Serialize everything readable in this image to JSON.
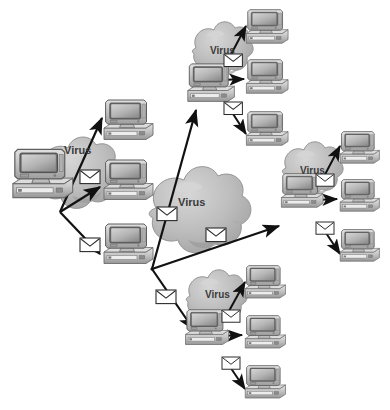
{
  "figure": {
    "background_color": "#ffffff",
    "width": 390,
    "height": 410
  },
  "palette": {
    "cloud_fill": "#bdbdbd",
    "cloud_shade": "#a2a2a2",
    "cloud_highlight": "#d2d2d2",
    "cloud_outline": "#8f8f8f",
    "monitor_case": "#c9c9c9",
    "monitor_case_dark": "#9a9a9a",
    "monitor_bezel": "#6f6f6f",
    "screen_light": "#cfcfcf",
    "screen_dark": "#8e8e8e",
    "base_light": "#d6d6d6",
    "base_dark": "#9c9c9c",
    "arrow_color": "#111111",
    "envelope_fill": "#ffffff",
    "envelope_stroke": "#2a2a2a",
    "label_color": "#3b3b3b"
  },
  "labels": {
    "virus": "Virus"
  },
  "icons": {
    "computer": "computer-icon",
    "envelope": "envelope-icon",
    "cloud": "virus-cloud-icon",
    "arrow": "arrow-icon"
  },
  "clusters": [
    {
      "id": "origin",
      "name": "origin-cluster",
      "virus_label": "Virus",
      "source_computer": {
        "name": "source-computer",
        "x": 10,
        "y": 148,
        "scale": 1.18
      },
      "cloud": {
        "x": 112,
        "y": 155,
        "scale": 1.0
      },
      "label_pos": {
        "x": 64,
        "y": 152
      },
      "targets": [
        {
          "name": "target-computer-1",
          "x": 104,
          "y": 100,
          "scale": 0.96
        },
        {
          "name": "target-computer-2",
          "x": 104,
          "y": 158,
          "scale": 0.96
        },
        {
          "name": "target-computer-3",
          "x": 104,
          "y": 218,
          "scale": 0.96
        }
      ],
      "envelopes": [
        {
          "name": "envelope-1",
          "x": 78,
          "y": 172
        },
        {
          "name": "envelope-2",
          "x": 78,
          "y": 238
        }
      ]
    },
    {
      "id": "top",
      "name": "top-cluster",
      "virus_label": "Virus",
      "source_computer": {
        "name": "source-computer",
        "x": 186,
        "y": 60,
        "scale": 0.92
      },
      "cloud": {
        "x": 243,
        "y": 28,
        "scale": 0.74
      },
      "label_pos": {
        "x": 212,
        "y": 52
      },
      "targets": [
        {
          "name": "target-computer-1",
          "x": 245,
          "y": 10,
          "scale": 0.82
        },
        {
          "name": "target-computer-2",
          "x": 245,
          "y": 60,
          "scale": 0.82
        },
        {
          "name": "target-computer-3",
          "x": 245,
          "y": 110,
          "scale": 0.82
        }
      ],
      "envelopes": [
        {
          "name": "envelope-1",
          "x": 225,
          "y": 54
        },
        {
          "name": "envelope-2",
          "x": 225,
          "y": 101
        }
      ]
    },
    {
      "id": "right",
      "name": "right-cluster",
      "virus_label": "Virus",
      "source_computer": {
        "name": "source-computer",
        "x": 282,
        "y": 172
      },
      "cloud": {
        "x": 330,
        "y": 140,
        "scale": 0.74
      },
      "label_pos": {
        "x": 306,
        "y": 172
      },
      "targets": [
        {
          "name": "target-computer-1",
          "x": 338,
          "y": 130
        },
        {
          "name": "target-computer-2",
          "x": 338,
          "y": 179
        },
        {
          "name": "target-computer-3",
          "x": 338,
          "y": 228
        }
      ],
      "envelopes": [
        {
          "name": "envelope-1",
          "x": 318,
          "y": 175
        },
        {
          "name": "envelope-2",
          "x": 318,
          "y": 222
        }
      ]
    },
    {
      "id": "bottom",
      "name": "bottom-cluster",
      "virus_label": "Virus",
      "source_computer": {
        "name": "source-computer",
        "x": 185,
        "y": 308
      },
      "cloud": {
        "x": 234,
        "y": 272
      },
      "label_pos": {
        "x": 207,
        "y": 298
      },
      "targets": [
        {
          "name": "target-computer-1",
          "x": 244,
          "y": 265
        },
        {
          "name": "target-computer-2",
          "x": 244,
          "y": 314
        },
        {
          "name": "target-computer-3",
          "x": 244,
          "y": 363
        }
      ],
      "envelopes": [
        {
          "name": "envelope-1",
          "x": 225,
          "y": 308
        },
        {
          "name": "envelope-2",
          "x": 225,
          "y": 355
        }
      ]
    }
  ],
  "central_cloud": {
    "name": "central-virus-cloud",
    "virus_label": "Virus",
    "label_pos": {
      "x": 190,
      "y": 203
    },
    "envelopes": [
      {
        "name": "envelope-center-left",
        "x": 159,
        "y": 207
      },
      {
        "name": "envelope-center-right",
        "x": 207,
        "y": 228
      }
    ]
  },
  "hub": {
    "name": "distribution-hub",
    "x": 152,
    "y": 269
  },
  "long_arrows": [
    {
      "name": "arrow-to-top-cluster",
      "from": [
        152,
        269
      ],
      "to": [
        196,
        107
      ]
    },
    {
      "name": "arrow-to-right-cluster",
      "from": [
        152,
        269
      ],
      "to": [
        281,
        225
      ]
    },
    {
      "name": "arrow-to-bottom-cluster",
      "from": [
        152,
        269
      ],
      "to": [
        196,
        330
      ]
    }
  ],
  "origin_arrows": [
    {
      "name": "arrow-origin-to-target-1",
      "from": [
        62,
        208
      ],
      "to": [
        101,
        118
      ]
    },
    {
      "name": "arrow-origin-to-target-2",
      "from": [
        62,
        208
      ],
      "to": [
        101,
        186
      ]
    },
    {
      "name": "arrow-origin-to-target-3",
      "from": [
        62,
        208
      ],
      "to": [
        101,
        256
      ]
    }
  ],
  "outbound_envelopes": [
    {
      "name": "envelope-to-top",
      "x": 160,
      "y": 250
    },
    {
      "name": "envelope-to-right",
      "x": 208,
      "y": 247
    },
    {
      "name": "envelope-to-bottom",
      "x": 158,
      "y": 295
    }
  ]
}
